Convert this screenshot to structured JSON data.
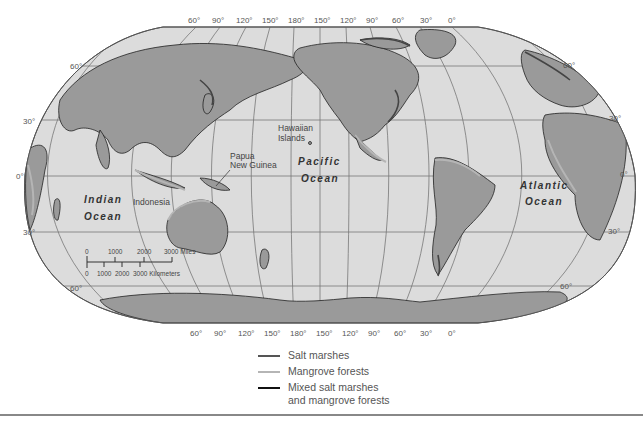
{
  "map": {
    "title": "",
    "colors": {
      "ocean": "#dcdcdc",
      "land": "#9a9a9a",
      "gridline": "#666666",
      "salt_marsh": "#444444",
      "mangrove": "#b5b5b5",
      "mixed": "#111111"
    },
    "top_longitude_ticks": [
      "60°",
      "90°",
      "120°",
      "150°",
      "180°",
      "150°",
      "120°",
      "90°",
      "60°",
      "30°",
      "0°"
    ],
    "bottom_longitude_ticks": [
      "60°",
      "90°",
      "120°",
      "150°",
      "180°",
      "150°",
      "120°",
      "90°",
      "60°",
      "30°",
      "0°"
    ],
    "left_latitude_ticks": [
      "60°",
      "30°",
      "0°",
      "30°",
      "60°"
    ],
    "right_latitude_ticks": [
      "60°",
      "30°",
      "0°",
      "30°",
      "60°"
    ],
    "ocean_labels": {
      "indian": [
        "Indian",
        "Ocean"
      ],
      "pacific": [
        "Pacific",
        "Ocean"
      ],
      "atlantic": [
        "Atlantic",
        "Ocean"
      ]
    },
    "place_labels": {
      "hawaii": [
        "Hawaiian",
        "Islands"
      ],
      "png": [
        "Papua",
        "New Guinea"
      ],
      "indonesia": "Indonesia"
    },
    "scale_bar": {
      "miles_ticks": [
        "0",
        "1000",
        "2000",
        "3000 Miles"
      ],
      "km_ticks": [
        "0",
        "1000",
        "2000",
        "3000 Kilometers"
      ]
    }
  },
  "legend": {
    "items": [
      {
        "label": "Salt marshes",
        "color": "#555555"
      },
      {
        "label": "Mangrove forests",
        "color": "#b5b5b5"
      },
      {
        "label_line1": "Mixed salt marshes",
        "label_line2": "and mangrove forests",
        "color": "#111111"
      }
    ]
  }
}
